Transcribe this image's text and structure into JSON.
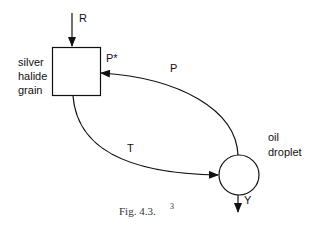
{
  "nodes": {
    "grain": {
      "label_lines": [
        "silver",
        "halide",
        "grain"
      ],
      "shape": "square"
    },
    "droplet": {
      "label_lines": [
        "oil",
        "droplet"
      ],
      "shape": "circle"
    }
  },
  "edges": {
    "R": {
      "label": "R",
      "from": "input",
      "to": "grain"
    },
    "P": {
      "label": "P",
      "from": "droplet",
      "to": "grain"
    },
    "P_star": {
      "label": "P*"
    },
    "T": {
      "label": "T",
      "from": "grain",
      "to": "droplet"
    },
    "Y": {
      "label": "Y",
      "from": "droplet",
      "to": "output"
    }
  },
  "caption": {
    "text": "Fig. 4.3.",
    "footnote": "3"
  },
  "colors": {
    "stroke": "#111111",
    "background": "#ffffff"
  }
}
